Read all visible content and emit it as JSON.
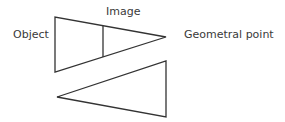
{
  "labels": {
    "object": "Object",
    "image": "Image",
    "geometral_point": "Geometral point"
  },
  "colors": {
    "stroke": "#333333",
    "text": "#3a3a3a",
    "background": "#ffffff"
  }
}
